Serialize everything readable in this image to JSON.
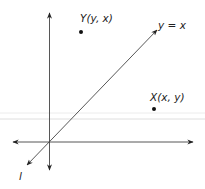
{
  "diagram": {
    "type": "coordinate-reflection",
    "colors": {
      "line": "#333333",
      "point": "#111111",
      "guide": "#e2e2e2",
      "background": "#ffffff"
    },
    "axes": {
      "origin": [
        49,
        142
      ],
      "x_axis": {
        "from": [
          13,
          142
        ],
        "to": [
          193,
          142
        ],
        "arrows": "both"
      },
      "y_axis": {
        "from": [
          49,
          13
        ],
        "to": [
          49,
          170
        ],
        "arrows": "both"
      }
    },
    "line_l": {
      "label": "l",
      "equation_label": "y = x",
      "from": [
        27,
        165
      ],
      "to": [
        157,
        30
      ]
    },
    "points": [
      {
        "name": "Y",
        "label": "Y(y, x)",
        "pos": [
          81,
          32
        ]
      },
      {
        "name": "X",
        "label": "X(x, y)",
        "pos": [
          154,
          109
        ]
      }
    ]
  }
}
